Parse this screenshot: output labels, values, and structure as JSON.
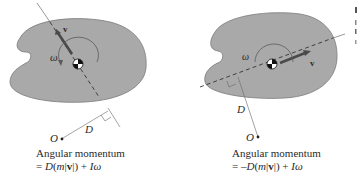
{
  "panels": [
    {
      "id": "left",
      "labels": {
        "omega": "ω",
        "velocity": "v",
        "distance": "D",
        "origin": "O"
      },
      "caption": {
        "title": "Angular momentum",
        "equation_prefix": "= ",
        "equation_D": "D",
        "equation_mid": "(",
        "equation_m": "m",
        "equation_bar": "|",
        "equation_v": "v",
        "equation_close": "|) + ",
        "equation_I": "I",
        "equation_omega": "ω"
      }
    },
    {
      "id": "right",
      "labels": {
        "omega": "ω",
        "velocity": "v",
        "distance": "D",
        "origin": "O"
      },
      "caption": {
        "title": "Angular momentum",
        "equation_prefix": "= –",
        "equation_D": "D",
        "equation_mid": "(",
        "equation_m": "m",
        "equation_bar": "|",
        "equation_v": "v",
        "equation_close": "|) + ",
        "equation_I": "I",
        "equation_omega": "ω"
      }
    }
  ],
  "colors": {
    "body_fill": "#a9a9a9",
    "body_stroke": "#7a7a7a",
    "line": "#555555",
    "arrow": "#4a4a4a",
    "text": "#2a2a2a"
  }
}
